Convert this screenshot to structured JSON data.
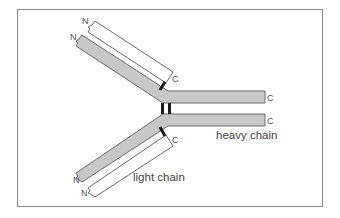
{
  "diagram": {
    "labels": {
      "heavy_chain": "heavy chain",
      "light_chain": "light chain"
    },
    "termini": {
      "n": "N",
      "c": "C"
    },
    "colors": {
      "heavy_chain_fill": "#c8c8c8",
      "light_chain_fill": "#ffffff",
      "outline": "#6a6a6a",
      "disulfide_bond": "#1a1a1a",
      "frame": "#888888"
    },
    "components": [
      {
        "id": "heavy-chain-1",
        "type": "heavy chain",
        "n_terminus": "N",
        "c_terminus": "C"
      },
      {
        "id": "heavy-chain-2",
        "type": "heavy chain",
        "n_terminus": "N",
        "c_terminus": "C"
      },
      {
        "id": "light-chain-1",
        "type": "light chain",
        "n_terminus": "N",
        "c_terminus": "C"
      },
      {
        "id": "light-chain-2",
        "type": "light chain",
        "n_terminus": "N",
        "c_terminus": "C"
      }
    ],
    "bonds": [
      {
        "between": [
          "heavy-chain-1",
          "heavy-chain-2"
        ],
        "count": 2
      },
      {
        "between": [
          "heavy-chain-1",
          "light-chain-1"
        ],
        "count": 1
      },
      {
        "between": [
          "heavy-chain-2",
          "light-chain-2"
        ],
        "count": 1
      }
    ]
  }
}
